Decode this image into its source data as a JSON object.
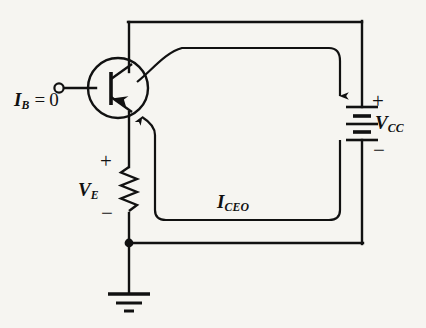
{
  "figure": {
    "name": "transistor-iceo-circuit",
    "background_color": "#f6f5f1",
    "line_color": "#111111",
    "width": 426,
    "height": 328
  },
  "labels": {
    "base_current": {
      "symbol": "I",
      "subscript": "B",
      "equals": "=",
      "value": "0",
      "full_text": "I_B = 0"
    },
    "emitter_voltage": {
      "symbol": "V",
      "subscript": "E",
      "full_text": "V_E"
    },
    "supply_voltage": {
      "symbol": "V",
      "subscript": "CC",
      "full_text": "V_CC"
    },
    "leakage_current": {
      "symbol": "I",
      "subscript": "CEO",
      "full_text": "I_CEO"
    }
  },
  "polarity": {
    "emitter_resistor_plus": "+",
    "emitter_resistor_minus": "−",
    "battery_plus": "+",
    "battery_minus": "−"
  },
  "components": {
    "transistor": {
      "type": "pnp-transistor",
      "terminals": [
        "base",
        "collector",
        "emitter"
      ],
      "emitter_arrow_direction": "into-base"
    },
    "resistor": {
      "type": "resistor-zigzag",
      "orientation": "vertical"
    },
    "battery": {
      "type": "battery-dc-source",
      "plates": 4,
      "orientation": "vertical"
    },
    "ground": {
      "type": "ground-symbol",
      "bars": 3
    },
    "base_terminal": {
      "type": "open-terminal-node"
    },
    "junction": {
      "type": "wire-junction-dot"
    },
    "current_loop": {
      "type": "current-flow-arrow-loop",
      "arrowheads": 2
    }
  }
}
